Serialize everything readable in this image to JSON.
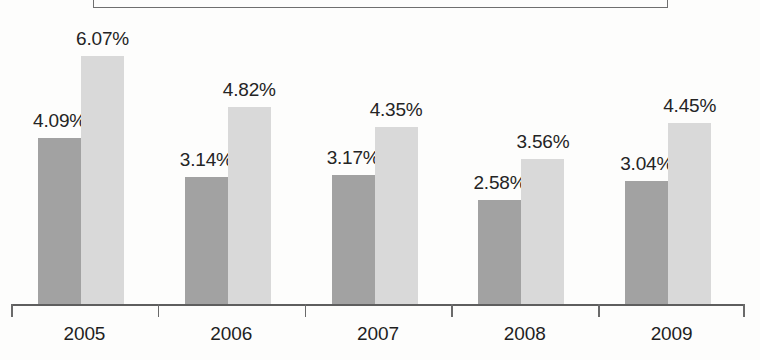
{
  "chart_data": {
    "type": "bar",
    "title": "",
    "subtitle": "",
    "xlabel": "",
    "ylabel": "",
    "categories": [
      "2005",
      "2006",
      "2007",
      "2008",
      "2009"
    ],
    "series": [
      {
        "name": "series-1",
        "color": "#a2a2a2",
        "values": [
          4.09,
          3.14,
          3.17,
          2.58,
          3.04
        ],
        "labels": [
          "4.09%",
          "3.14%",
          "3.17%",
          "2.58%",
          "3.04%"
        ]
      },
      {
        "name": "series-2",
        "color": "#d9d9d9",
        "values": [
          6.07,
          4.82,
          4.35,
          3.56,
          4.45
        ],
        "labels": [
          "6.07%",
          "4.82%",
          "4.35%",
          "3.56%",
          "4.45%"
        ]
      }
    ],
    "ylim": [
      0,
      7.2
    ],
    "grid": false,
    "legend_position": "top",
    "value_labels_shown": true,
    "axis_line_color": "#5e5e5e",
    "label_text_color": "#1f1f1f"
  },
  "axis": {
    "ticks": [
      "",
      "",
      "",
      "",
      "",
      ""
    ]
  },
  "legend": {
    "box_visible": true,
    "box_border_color": "#6f6f6f",
    "entries": []
  }
}
